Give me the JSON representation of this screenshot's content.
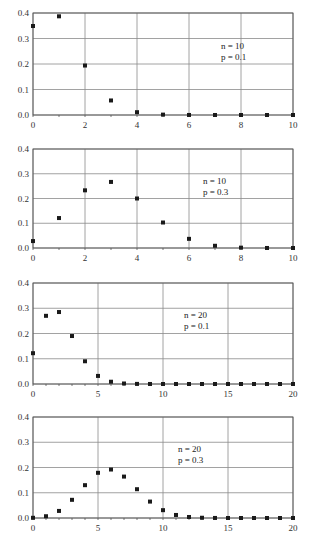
{
  "chart_data": [
    {
      "type": "scatter",
      "title": "",
      "annotation": [
        "n = 10",
        "p = 0.1"
      ],
      "xlabel": "",
      "ylabel": "",
      "xlim": [
        0,
        10
      ],
      "ylim": [
        0,
        0.4
      ],
      "xticks": [
        0,
        2,
        4,
        6,
        8,
        10
      ],
      "yticks": [
        "0.0",
        "0.1",
        "0.2",
        "0.3",
        "0.4"
      ],
      "grid": true,
      "x": [
        0,
        1,
        2,
        3,
        4,
        5,
        6,
        7,
        8,
        9,
        10
      ],
      "values": [
        0.349,
        0.387,
        0.194,
        0.057,
        0.011,
        0.0015,
        0.0001,
        0,
        0,
        0,
        0
      ]
    },
    {
      "type": "scatter",
      "title": "",
      "annotation": [
        "n = 10",
        "p = 0.3"
      ],
      "xlabel": "",
      "ylabel": "",
      "xlim": [
        0,
        10
      ],
      "ylim": [
        0,
        0.4
      ],
      "xticks": [
        0,
        2,
        4,
        6,
        8,
        10
      ],
      "yticks": [
        "0.0",
        "0.1",
        "0.2",
        "0.3",
        "0.4"
      ],
      "grid": true,
      "x": [
        0,
        1,
        2,
        3,
        4,
        5,
        6,
        7,
        8,
        9,
        10
      ],
      "values": [
        0.028,
        0.121,
        0.233,
        0.267,
        0.2,
        0.103,
        0.037,
        0.009,
        0.0014,
        0.0001,
        0
      ]
    },
    {
      "type": "scatter",
      "title": "",
      "annotation": [
        "n = 20",
        "p = 0.1"
      ],
      "xlabel": "",
      "ylabel": "",
      "xlim": [
        0,
        20
      ],
      "ylim": [
        0,
        0.4
      ],
      "xticks": [
        0,
        5,
        10,
        15,
        20
      ],
      "yticks": [
        "0.0",
        "0.1",
        "0.2",
        "0.3",
        "0.4"
      ],
      "grid": true,
      "x": [
        0,
        1,
        2,
        3,
        4,
        5,
        6,
        7,
        8,
        9,
        10,
        11,
        12,
        13,
        14,
        15,
        16,
        17,
        18,
        19,
        20
      ],
      "values": [
        0.122,
        0.27,
        0.285,
        0.19,
        0.09,
        0.032,
        0.009,
        0.002,
        0.0004,
        0.0001,
        0,
        0,
        0,
        0,
        0,
        0,
        0,
        0,
        0,
        0,
        0
      ]
    },
    {
      "type": "scatter",
      "title": "",
      "annotation": [
        "n = 20",
        "p = 0.3"
      ],
      "xlabel": "",
      "ylabel": "",
      "xlim": [
        0,
        20
      ],
      "ylim": [
        0,
        0.4
      ],
      "xticks": [
        0,
        5,
        10,
        15,
        20
      ],
      "yticks": [
        "0.0",
        "0.1",
        "0.2",
        "0.3",
        "0.4"
      ],
      "grid": true,
      "x": [
        0,
        1,
        2,
        3,
        4,
        5,
        6,
        7,
        8,
        9,
        10,
        11,
        12,
        13,
        14,
        15,
        16,
        17,
        18,
        19,
        20
      ],
      "values": [
        0.0008,
        0.007,
        0.028,
        0.072,
        0.13,
        0.179,
        0.192,
        0.164,
        0.114,
        0.065,
        0.031,
        0.012,
        0.004,
        0.001,
        0.0002,
        0,
        0,
        0,
        0,
        0,
        0
      ]
    }
  ],
  "layout": {
    "panels": [
      {
        "left": 33,
        "right": 293,
        "top": 13,
        "bottom": 115,
        "note_x": 221,
        "note_y": 49
      },
      {
        "left": 33,
        "right": 293,
        "top": 149,
        "bottom": 248,
        "note_x": 203,
        "note_y": 184
      },
      {
        "left": 33,
        "right": 293,
        "top": 283,
        "bottom": 384,
        "note_x": 184,
        "note_y": 318
      },
      {
        "left": 33,
        "right": 293,
        "top": 417,
        "bottom": 518,
        "note_x": 178,
        "note_y": 452
      }
    ]
  }
}
